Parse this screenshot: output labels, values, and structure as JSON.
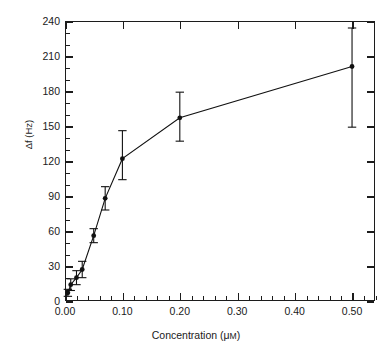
{
  "running_header": {
    "folio": "22",
    "text": "TESTING OF GENETICALLY MODIFIED ORGANISMS IN FOODS"
  },
  "chart_data": {
    "type": "line",
    "title": "",
    "subtitle": "",
    "xlabel": "Concentration (μM)",
    "ylabel": "Δf (Hz)",
    "xlim": [
      0.0,
      0.54
    ],
    "ylim": [
      0,
      240
    ],
    "xticks": [
      0.0,
      0.1,
      0.2,
      0.3,
      0.4,
      0.5
    ],
    "xtick_labels": [
      "0.00",
      "0.10",
      "0.20",
      "0.30",
      "0.40",
      "0.50"
    ],
    "xtick_minor_step": 0.02,
    "yticks": [
      0,
      30,
      60,
      90,
      120,
      150,
      180,
      210,
      240
    ],
    "ytick_labels": [
      "0",
      "30",
      "60",
      "90",
      "120",
      "150",
      "180",
      "210",
      "240"
    ],
    "ytick_minor_step": 10,
    "grid": false,
    "legend": "none",
    "marker": "filled-circle",
    "error_bars": "vertical",
    "series": [
      {
        "name": "Δf response",
        "x": [
          0.005,
          0.01,
          0.02,
          0.03,
          0.05,
          0.07,
          0.1,
          0.2,
          0.5
        ],
        "y": [
          7,
          14,
          20,
          27,
          56,
          88,
          122,
          157,
          201
        ],
        "yerr_low": [
          3,
          5,
          6,
          7,
          6,
          10,
          18,
          20,
          52
        ],
        "yerr_high": [
          3,
          5,
          6,
          7,
          6,
          10,
          24,
          22,
          33
        ]
      }
    ]
  }
}
